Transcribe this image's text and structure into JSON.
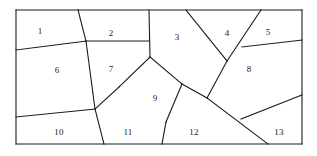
{
  "figure": {
    "name": "partitioned-rectangle-diagram",
    "canvas": {
      "width": 317,
      "height": 156
    },
    "background_color": "#ffffff",
    "stroke_color": "#1a1a1a",
    "stroke_width": 1.1,
    "border": {
      "x": 16,
      "y": 10,
      "width": 286,
      "height": 134
    },
    "region_count": 13,
    "regions": [
      {
        "id": 1,
        "label": "1",
        "label_x": 40,
        "label_y": 31
      },
      {
        "id": 2,
        "label": "2",
        "label_x": 111,
        "label_y": 33
      },
      {
        "id": 3,
        "label": "3",
        "label_x": 177,
        "label_y": 37
      },
      {
        "id": 4,
        "label": "4",
        "label_x": 227,
        "label_y": 33
      },
      {
        "id": 5,
        "label": "5",
        "label_x": 268,
        "label_y": 32
      },
      {
        "id": 6,
        "label": "6",
        "label_x": 57,
        "label_y": 70
      },
      {
        "id": 7,
        "label": "7",
        "label_x": 111,
        "label_y": 69
      },
      {
        "id": 8,
        "label": "8",
        "label_x": 249,
        "label_y": 69
      },
      {
        "id": 9,
        "label": "9",
        "label_x": 155,
        "label_y": 98
      },
      {
        "id": 10,
        "label": "10",
        "label_x": 59,
        "label_y": 132
      },
      {
        "id": 11,
        "label": "11",
        "label_x": 128,
        "label_y": 132
      },
      {
        "id": 12,
        "label": "12",
        "label_x": 194,
        "label_y": 132
      },
      {
        "id": 13,
        "label": "13",
        "label_x": 279,
        "label_y": 132
      }
    ],
    "segments": [
      {
        "name": "border-top",
        "x1": 16,
        "y1": 10,
        "x2": 302,
        "y2": 10
      },
      {
        "name": "border-right",
        "x1": 302,
        "y1": 10,
        "x2": 302,
        "y2": 144
      },
      {
        "name": "border-bottom",
        "x1": 302,
        "y1": 144,
        "x2": 16,
        "y2": 144
      },
      {
        "name": "border-left",
        "x1": 16,
        "y1": 144,
        "x2": 16,
        "y2": 10
      },
      {
        "name": "edge-1-6",
        "x1": 16,
        "y1": 50,
        "x2": 86,
        "y2": 41
      },
      {
        "name": "edge-top-to-node-a",
        "x1": 78,
        "y1": 10,
        "x2": 86,
        "y2": 41
      },
      {
        "name": "edge-node-a-to-node-b",
        "x1": 86,
        "y1": 41,
        "x2": 95,
        "y2": 109
      },
      {
        "name": "edge-2-7-horizontal",
        "x1": 86,
        "y1": 41,
        "x2": 149,
        "y2": 41
      },
      {
        "name": "edge-2-3-vertical",
        "x1": 149,
        "y1": 10,
        "x2": 150,
        "y2": 57
      },
      {
        "name": "edge-6-10",
        "x1": 16,
        "y1": 117,
        "x2": 95,
        "y2": 109
      },
      {
        "name": "edge-node-b-to-bottom",
        "x1": 95,
        "y1": 109,
        "x2": 104,
        "y2": 144
      },
      {
        "name": "edge-7-9-left",
        "x1": 150,
        "y1": 57,
        "x2": 119,
        "y2": 87
      },
      {
        "name": "edge-9-11",
        "x1": 119,
        "y1": 87,
        "x2": 95,
        "y2": 109
      },
      {
        "name": "edge-3-9-right",
        "x1": 150,
        "y1": 57,
        "x2": 182,
        "y2": 84
      },
      {
        "name": "edge-9-12",
        "x1": 182,
        "y1": 84,
        "x2": 166,
        "y2": 122
      },
      {
        "name": "edge-11-12-bottom",
        "x1": 166,
        "y1": 122,
        "x2": 162,
        "y2": 144
      },
      {
        "name": "edge-3-8-to-node-c",
        "x1": 182,
        "y1": 84,
        "x2": 207,
        "y2": 98
      },
      {
        "name": "edge-4-left-arm",
        "x1": 186,
        "y1": 10,
        "x2": 227,
        "y2": 61
      },
      {
        "name": "edge-4-right-arm",
        "x1": 261,
        "y1": 10,
        "x2": 227,
        "y2": 61
      },
      {
        "name": "edge-v-to-node-c",
        "x1": 227,
        "y1": 61,
        "x2": 207,
        "y2": 98
      },
      {
        "name": "edge-5-8",
        "x1": 242,
        "y1": 47,
        "x2": 302,
        "y2": 40
      },
      {
        "name": "edge-12-13-diagonal",
        "x1": 207,
        "y1": 98,
        "x2": 268,
        "y2": 144
      },
      {
        "name": "edge-8-13",
        "x1": 241,
        "y1": 119,
        "x2": 302,
        "y2": 95
      }
    ]
  }
}
